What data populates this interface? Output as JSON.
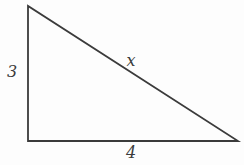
{
  "figure": {
    "type": "right-triangle",
    "background_color": "#fdfdfd",
    "line_color": "#3b3b3b",
    "line_width": 1.8,
    "canvas": {
      "width": 244,
      "height": 165
    },
    "vertices": {
      "apex": {
        "x": 28,
        "y": 6
      },
      "right_angle_corner": {
        "x": 28,
        "y": 141
      },
      "bottom_right": {
        "x": 238,
        "y": 141
      }
    },
    "labels": {
      "left_leg": {
        "text": "3",
        "x": 12,
        "y": 72
      },
      "hypotenuse": {
        "text": "x",
        "x": 131,
        "y": 61
      },
      "base": {
        "text": "4",
        "x": 131,
        "y": 153
      }
    }
  }
}
